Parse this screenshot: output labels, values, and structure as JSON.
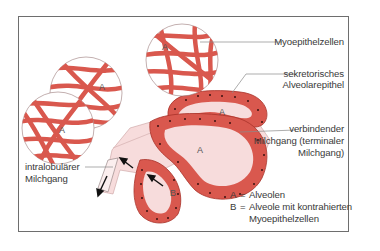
{
  "diagram": {
    "type": "anatomical-illustration",
    "colors": {
      "frame": "#6e6e6e",
      "myoepithel": "#d9584e",
      "myoepithel_dark": "#b8372f",
      "epithel": "#d9584e",
      "lumen": "#f7dcdc",
      "nucleus": "#3a1010",
      "text": "#3a3a3a",
      "leader_line": "#8a8a8a"
    },
    "labels": {
      "myoepithelzellen": "Myoepithelzellen",
      "sekretorisches_line1": "sekretorisches",
      "sekretorisches_line2": "Alveolarepithel",
      "verbindender_line1": "verbindender",
      "verbindender_line2": "Milchgang (terminaler",
      "verbindender_line3": "Milchgang)",
      "intralobulaer_line1": "intralobulärer",
      "intralobulaer_line2": "Milchgang"
    },
    "alveolus_marks": [
      "A",
      "A",
      "A",
      "A",
      "A",
      "B"
    ],
    "legend": {
      "a_key": "A",
      "a_eq": "=",
      "a_text": "Alveolen",
      "b_key": "B",
      "b_eq": "=",
      "b_text_line1": "Alveole mit kontrahierten",
      "b_text_line2": "Myoepithelzellen"
    }
  }
}
